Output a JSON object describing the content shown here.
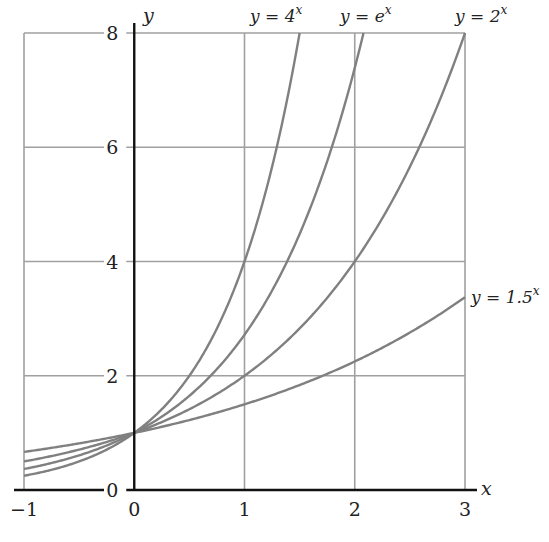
{
  "chart_data": {
    "type": "line",
    "title": "",
    "xlabel": "x",
    "ylabel": "y",
    "xlim": [
      -1,
      3
    ],
    "ylim": [
      0,
      8
    ],
    "grid": true,
    "x_ticks": [
      -1,
      0,
      1,
      2,
      3
    ],
    "x_tick_labels": [
      "−1",
      "0",
      "1",
      "2",
      "3"
    ],
    "y_ticks": [
      0,
      2,
      4,
      6,
      8
    ],
    "y_tick_labels": [
      "0",
      "2",
      "4",
      "6",
      "8"
    ],
    "legend": "inline labels at curve ends",
    "series": [
      {
        "name": "y = 4^x",
        "label_base": "y = 4",
        "label_exp": "x",
        "base": 4,
        "x": [
          -1,
          -0.5,
          0,
          0.5,
          1,
          1.25,
          1.5
        ],
        "values": [
          0.25,
          0.5,
          1,
          2,
          4,
          5.66,
          8
        ]
      },
      {
        "name": "y = e^x",
        "label_base": "y = e",
        "label_exp": "x",
        "base": 2.718281828,
        "x": [
          -1,
          -0.5,
          0,
          0.5,
          1,
          1.5,
          2,
          2.079
        ],
        "values": [
          0.37,
          0.61,
          1,
          1.65,
          2.72,
          4.48,
          7.39,
          8
        ]
      },
      {
        "name": "y = 2^x",
        "label_base": "y = 2",
        "label_exp": "x",
        "base": 2,
        "x": [
          -1,
          0,
          1,
          2,
          3
        ],
        "values": [
          0.5,
          1,
          2,
          4,
          8
        ]
      },
      {
        "name": "y = 1.5^x",
        "label_base": "y = 1.5",
        "label_exp": "x",
        "base": 1.5,
        "x": [
          -1,
          0,
          1,
          2,
          3
        ],
        "values": [
          0.67,
          1,
          1.5,
          2.25,
          3.375
        ]
      }
    ]
  },
  "labels": {
    "x_axis": "x",
    "y_axis": "y",
    "y_zero": "0",
    "x_zero": "0",
    "curves": {
      "four": {
        "base": "y = 4",
        "exp": "x"
      },
      "e": {
        "base": "y = e",
        "exp": "x"
      },
      "two": {
        "base": "y = 2",
        "exp": "x"
      },
      "onefive": {
        "base": "y = 1.5",
        "exp": "x"
      }
    }
  },
  "colors": {
    "curve": "#808080",
    "grid": "#a0a0a0",
    "axis": "#111111",
    "text": "#222222"
  }
}
